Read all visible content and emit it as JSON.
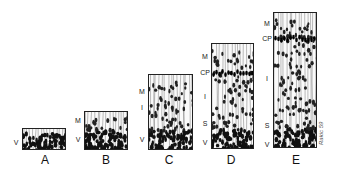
{
  "figure": {
    "stages": [
      {
        "id": "A",
        "label": "A",
        "box": {
          "x": 22,
          "y": 128,
          "w": 44,
          "h": 22
        },
        "layers": [
          {
            "label": "V",
            "y": 142
          }
        ],
        "label_pos": {
          "x": 45,
          "y": 160
        }
      },
      {
        "id": "B",
        "label": "B",
        "box": {
          "x": 84,
          "y": 111,
          "w": 44,
          "h": 39
        },
        "layers": [
          {
            "label": "M",
            "y": 120
          },
          {
            "label": "V",
            "y": 139
          }
        ],
        "label_pos": {
          "x": 106,
          "y": 160
        }
      },
      {
        "id": "C",
        "label": "C",
        "box": {
          "x": 148,
          "y": 74,
          "w": 45,
          "h": 76
        },
        "layers": [
          {
            "label": "M",
            "y": 91
          },
          {
            "label": "I",
            "y": 107
          },
          {
            "label": "V",
            "y": 139
          }
        ],
        "label_pos": {
          "x": 169,
          "y": 160
        }
      },
      {
        "id": "D",
        "label": "D",
        "box": {
          "x": 211,
          "y": 43,
          "w": 43,
          "h": 106
        },
        "layers": [
          {
            "label": "M",
            "y": 56
          },
          {
            "label": "CP",
            "y": 72
          },
          {
            "label": "I",
            "y": 96
          },
          {
            "label": "S",
            "y": 123
          },
          {
            "label": "V",
            "y": 142
          }
        ],
        "label_pos": {
          "x": 231,
          "y": 160
        }
      },
      {
        "id": "E",
        "label": "E",
        "box": {
          "x": 273,
          "y": 12,
          "w": 44,
          "h": 136
        },
        "layers": [
          {
            "label": "M",
            "y": 23
          },
          {
            "label": "CP",
            "y": 38
          },
          {
            "label": "I",
            "y": 78
          },
          {
            "label": "S",
            "y": 125
          },
          {
            "label": "V",
            "y": 144
          }
        ],
        "label_pos": {
          "x": 296,
          "y": 160
        }
      }
    ],
    "signature": "Rakic 59"
  }
}
